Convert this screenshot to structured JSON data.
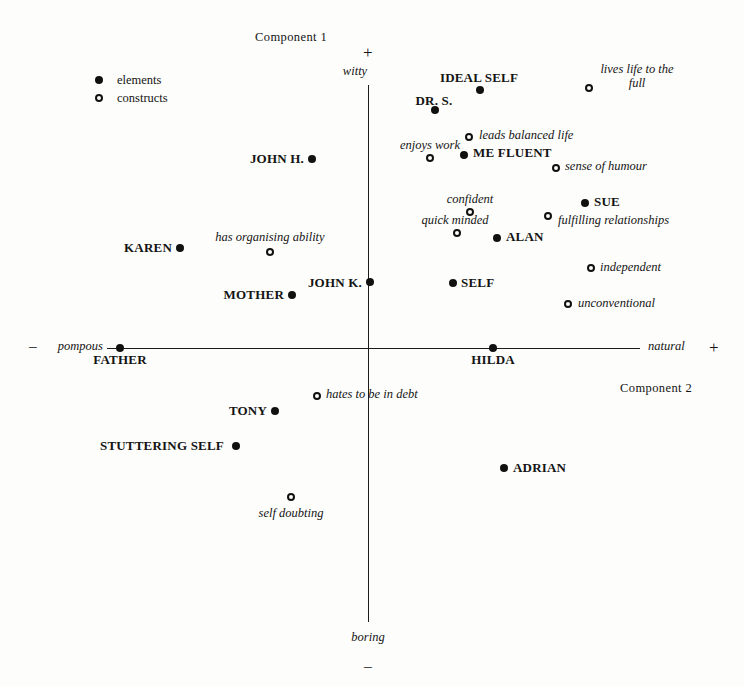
{
  "chart_data": {
    "type": "scatter",
    "axes": {
      "vertical": {
        "name": "Component 1",
        "positive_sign": "+",
        "negative_sign": "−",
        "positive_pole": "witty",
        "negative_pole": "boring"
      },
      "horizontal": {
        "name": "Component 2",
        "positive_sign": "+",
        "negative_sign": "−",
        "positive_pole": "natural",
        "negative_pole": "pompous"
      }
    },
    "legend": {
      "position": "top-left",
      "entries": [
        {
          "label": "elements",
          "marker": "filled-circle"
        },
        {
          "label": "constructs",
          "marker": "open-circle"
        }
      ]
    },
    "grid": false,
    "xlim": [
      -1,
      1
    ],
    "ylim": [
      -1,
      1
    ],
    "points": [
      {
        "label": "IDEAL SELF",
        "kind": "element",
        "px": 480,
        "py": 90,
        "lx": 479,
        "ly": 70,
        "align": "center"
      },
      {
        "label": "DR. S.",
        "kind": "element",
        "px": 435,
        "py": 110,
        "lx": 434,
        "ly": 93,
        "align": "center"
      },
      {
        "label": "lives life to the full",
        "kind": "construct",
        "px": 589,
        "py": 88,
        "lx": 637,
        "ly": 62,
        "align": "center",
        "two_line": true
      },
      {
        "label": "leads balanced life",
        "kind": "construct",
        "px": 469,
        "py": 137,
        "lx": 479,
        "ly": 128,
        "align": "left"
      },
      {
        "label": "ME FLUENT",
        "kind": "element",
        "px": 464,
        "py": 155,
        "lx": 473,
        "ly": 145,
        "align": "left"
      },
      {
        "label": "enjoys work",
        "kind": "construct",
        "px": 430,
        "py": 158,
        "lx": 430,
        "ly": 138,
        "align": "center"
      },
      {
        "label": "sense of humour",
        "kind": "construct",
        "px": 556,
        "py": 168,
        "lx": 565,
        "ly": 159,
        "align": "left"
      },
      {
        "label": "JOHN H.",
        "kind": "element",
        "px": 312,
        "py": 159,
        "lx": 304,
        "ly": 151,
        "align": "right"
      },
      {
        "label": "confident",
        "kind": "construct",
        "px": 470,
        "py": 212,
        "lx": 470,
        "ly": 192,
        "align": "center"
      },
      {
        "label": "SUE",
        "kind": "element",
        "px": 585,
        "py": 203,
        "lx": 594,
        "ly": 194,
        "align": "left"
      },
      {
        "label": "fulfilling relationships",
        "kind": "construct",
        "px": 548,
        "py": 216,
        "lx": 558,
        "ly": 213,
        "align": "left"
      },
      {
        "label": "quick minded",
        "kind": "construct",
        "px": 457,
        "py": 233,
        "lx": 455,
        "ly": 213,
        "align": "center"
      },
      {
        "label": "ALAN",
        "kind": "element",
        "px": 497,
        "py": 238,
        "lx": 506,
        "ly": 229,
        "align": "left"
      },
      {
        "label": "has organising ability",
        "kind": "construct",
        "px": 270,
        "py": 252,
        "lx": 270,
        "ly": 230,
        "align": "center"
      },
      {
        "label": "KAREN",
        "kind": "element",
        "px": 180,
        "py": 248,
        "lx": 172,
        "ly": 240,
        "align": "right"
      },
      {
        "label": "independent",
        "kind": "construct",
        "px": 591,
        "py": 268,
        "lx": 600,
        "ly": 260,
        "align": "left"
      },
      {
        "label": "JOHN K.",
        "kind": "element",
        "px": 370,
        "py": 282,
        "lx": 362,
        "ly": 275,
        "align": "right"
      },
      {
        "label": "SELF",
        "kind": "element",
        "px": 453,
        "py": 283,
        "lx": 461,
        "ly": 275,
        "align": "left"
      },
      {
        "label": "unconventional",
        "kind": "construct",
        "px": 568,
        "py": 304,
        "lx": 578,
        "ly": 296,
        "align": "left"
      },
      {
        "label": "MOTHER",
        "kind": "element",
        "px": 292,
        "py": 295,
        "lx": 284,
        "ly": 287,
        "align": "right"
      },
      {
        "label": "FATHER",
        "kind": "element",
        "px": 120,
        "py": 348,
        "lx": 120,
        "ly": 352,
        "align": "center"
      },
      {
        "label": "HILDA",
        "kind": "element",
        "px": 493,
        "py": 348,
        "lx": 493,
        "ly": 352,
        "align": "center"
      },
      {
        "label": "hates to be in debt",
        "kind": "construct",
        "px": 317,
        "py": 396,
        "lx": 326,
        "ly": 387,
        "align": "left"
      },
      {
        "label": "TONY",
        "kind": "element",
        "px": 275,
        "py": 411,
        "lx": 267,
        "ly": 403,
        "align": "right"
      },
      {
        "label": "STUTTERING SELF",
        "kind": "element",
        "px": 236,
        "py": 446,
        "lx": 224,
        "ly": 438,
        "align": "right"
      },
      {
        "label": "ADRIAN",
        "kind": "element",
        "px": 504,
        "py": 468,
        "lx": 513,
        "ly": 460,
        "align": "left"
      },
      {
        "label": "self doubting",
        "kind": "construct",
        "px": 291,
        "py": 497,
        "lx": 291,
        "ly": 506,
        "align": "center"
      }
    ]
  },
  "layout": {
    "vertical_axis": {
      "x": 368,
      "top": 85,
      "bottom": 622
    },
    "horizontal_axis": {
      "y": 348,
      "left": 107,
      "right": 640
    },
    "legend_marker_x": 99,
    "legend_rows_y": [
      80,
      98
    ],
    "legend_text_x": 117
  }
}
